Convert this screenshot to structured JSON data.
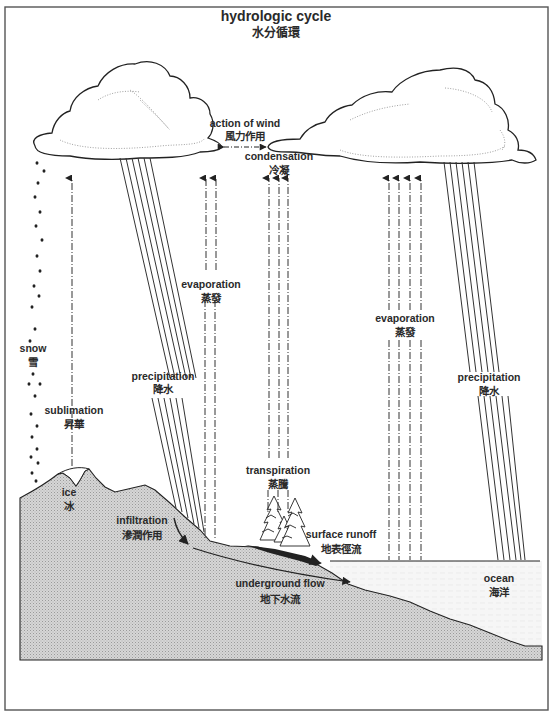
{
  "title": {
    "en": "hydrologic cycle",
    "zh": "水分循環"
  },
  "labels": {
    "action_of_wind": {
      "en": "action of wind",
      "zh": "風力作用"
    },
    "condensation": {
      "en": "condensation",
      "zh": "冷凝"
    },
    "evaporation_land": {
      "en": "evaporation",
      "zh": "蒸發"
    },
    "evaporation_ocean": {
      "en": "evaporation",
      "zh": "蒸發"
    },
    "precipitation_land": {
      "en": "precipitation",
      "zh": "降水"
    },
    "precipitation_ocean": {
      "en": "precipitation",
      "zh": "降水"
    },
    "snow": {
      "en": "snow",
      "zh": "雪"
    },
    "sublimation": {
      "en": "sublimation",
      "zh": "昇華"
    },
    "ice": {
      "en": "ice",
      "zh": "冰"
    },
    "infiltration": {
      "en": "infiltration",
      "zh": "滲潤作用"
    },
    "transpiration": {
      "en": "transpiration",
      "zh": "蒸騰"
    },
    "surface_runoff": {
      "en": "surface runoff",
      "zh": "地表徑流"
    },
    "underground_flow": {
      "en": "underground flow",
      "zh": "地下水流"
    },
    "ocean": {
      "en": "ocean",
      "zh": "海洋"
    }
  },
  "colors": {
    "ink": "#2a2a2a",
    "ground": "#c8c8c8",
    "ocean": "#f4f4f4",
    "frame": "#555555",
    "background": "#ffffff"
  }
}
